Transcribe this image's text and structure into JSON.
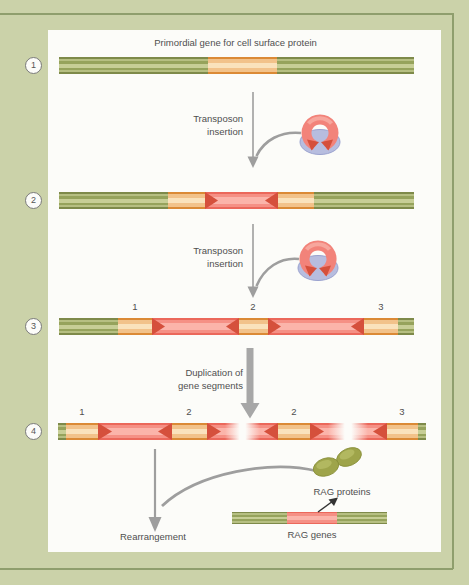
{
  "figure": {
    "title": "Primordial gene for cell surface protein",
    "steps": [
      "1",
      "2",
      "3",
      "4"
    ],
    "labels": {
      "transposon_insertion": [
        "Transposon",
        "insertion"
      ],
      "duplication": [
        "Duplication of",
        "gene segments"
      ],
      "rearrangement": "Rearrangement",
      "rag_proteins": "RAG proteins",
      "rag_genes": "RAG genes"
    },
    "segment_labels": {
      "bar3": [
        "1",
        "2",
        "3"
      ],
      "bar4": [
        "1",
        "2",
        "2",
        "3"
      ]
    },
    "colors": {
      "background": "#cbd2a9",
      "frame_line": "#8f9e6d",
      "panel": "#fcfcf9",
      "gene_green": "#96a35c",
      "exon_orange": "#f2c28a",
      "transposon_pink": "#f59085",
      "inverted_repeat_red": "#d5503c",
      "transposon_base_blue": "#b7bddf",
      "rag_protein_olive": "#9ea44a",
      "arrow_gray": "#9e9e9e"
    }
  }
}
